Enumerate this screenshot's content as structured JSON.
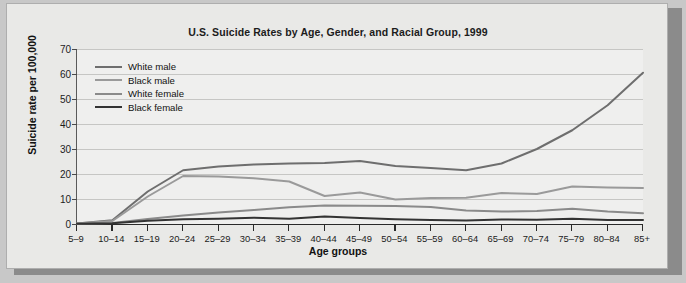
{
  "chart_data": {
    "type": "line",
    "title": "U.S. Suicide Rates by Age, Gender, and Racial Group, 1999",
    "xlabel": "Age groups",
    "ylabel": "Suicide rate per 100,000",
    "ylim": [
      0,
      70
    ],
    "yticks": [
      0,
      10,
      20,
      30,
      40,
      50,
      60,
      70
    ],
    "grid": true,
    "legend_position": "top-left",
    "categories": [
      "5–9",
      "10–14",
      "15–19",
      "20–24",
      "25–29",
      "30–34",
      "35–39",
      "40–44",
      "45–49",
      "50–54",
      "55–59",
      "60–64",
      "65–69",
      "70–74",
      "75–79",
      "80–84",
      "85+"
    ],
    "series": [
      {
        "name": "White male",
        "color": "#6e6e6e",
        "values": [
          0.2,
          1.5,
          13.0,
          21.5,
          23.0,
          23.8,
          24.2,
          24.4,
          25.2,
          23.2,
          22.4,
          21.5,
          24.2,
          30.0,
          37.5,
          47.5,
          60.5
        ]
      },
      {
        "name": "Black male",
        "color": "#9a9a9a",
        "values": [
          0.2,
          1.2,
          11.0,
          19.2,
          19.0,
          18.3,
          17.0,
          11.2,
          12.6,
          9.8,
          10.4,
          10.5,
          12.4,
          12.0,
          15.0,
          14.6,
          14.4
        ]
      },
      {
        "name": "White female",
        "color": "#8a8a8a",
        "values": [
          0.1,
          0.4,
          2.0,
          3.4,
          4.6,
          5.6,
          6.7,
          7.4,
          7.3,
          7.2,
          6.8,
          5.4,
          5.0,
          5.2,
          6.1,
          5.0,
          4.3
        ]
      },
      {
        "name": "Black female",
        "color": "#333333",
        "values": [
          0.1,
          0.3,
          1.3,
          1.9,
          2.1,
          2.5,
          2.1,
          3.0,
          2.4,
          1.9,
          1.6,
          1.4,
          1.8,
          1.7,
          2.1,
          1.6,
          1.6
        ]
      }
    ]
  }
}
